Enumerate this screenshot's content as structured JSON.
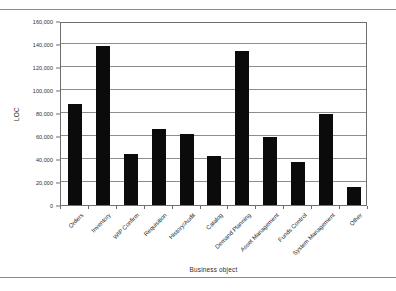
{
  "chart_data": {
    "type": "bar",
    "title": "",
    "xlabel": "Business object",
    "ylabel": "LOC",
    "ylim": [
      0,
      160000
    ],
    "ytick_step": 20000,
    "grid": true,
    "legend": null,
    "bar_color": "#0b0b0b",
    "frame_color": "#6e6e6e",
    "gridline_color": "#8d8d8d",
    "categories": [
      "Orders",
      "Inventory",
      "WIP Confirm",
      "Requisition",
      "History/Audit",
      "Catalog",
      "Demand Planning",
      "Asset Management",
      "Funds Control",
      "System Management",
      "Other"
    ],
    "values": [
      88000,
      138000,
      44000,
      66000,
      62000,
      43000,
      134000,
      59000,
      37000,
      79000,
      16000
    ],
    "ytick_labels": [
      "0",
      "20,000",
      "40,000",
      "60,000",
      "80,000",
      "100,000",
      "120,000",
      "140,000",
      "160,000"
    ],
    "ytick_values": [
      0,
      20000,
      40000,
      60000,
      80000,
      100000,
      120000,
      140000,
      160000
    ]
  }
}
